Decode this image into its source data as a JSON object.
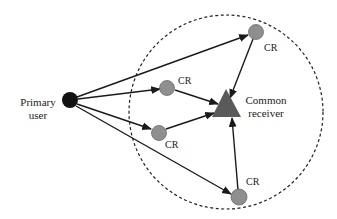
{
  "diagram": {
    "type": "cognitive-radio-network",
    "colors": {
      "primary_user": "#111111",
      "cr_node": "#8f8f8f",
      "cr_stroke": "#6a6a6a",
      "receiver": "#5a5a5a",
      "edge": "#1a1a1a",
      "boundary": "#222222",
      "text": "#222222"
    },
    "primary_user": {
      "label_line1": "Primary",
      "label_line2": "user"
    },
    "receiver": {
      "label_line1": "Common",
      "label_line2": "receiver"
    },
    "cr_nodes": [
      {
        "id": "cr-top-right",
        "label": "CR"
      },
      {
        "id": "cr-mid-upper",
        "label": "CR"
      },
      {
        "id": "cr-mid-lower",
        "label": "CR"
      },
      {
        "id": "cr-bottom",
        "label": "CR"
      }
    ],
    "edges": [
      {
        "from": "primary_user",
        "to": "cr-top-right"
      },
      {
        "from": "primary_user",
        "to": "cr-mid-upper"
      },
      {
        "from": "primary_user",
        "to": "cr-mid-lower"
      },
      {
        "from": "primary_user",
        "to": "cr-bottom"
      },
      {
        "from": "cr-top-right",
        "to": "receiver"
      },
      {
        "from": "cr-mid-upper",
        "to": "receiver"
      },
      {
        "from": "cr-mid-lower",
        "to": "receiver"
      },
      {
        "from": "cr-bottom",
        "to": "receiver"
      }
    ],
    "boundary": {
      "style": "dashed-circle"
    }
  }
}
